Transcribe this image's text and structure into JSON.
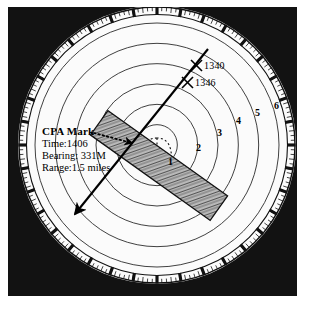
{
  "figure": {
    "name": "radar-plotting-scope"
  },
  "scope": {
    "background_color": "#121212",
    "face_color": "#ffffff",
    "line_color": "#1a1a1a",
    "center": {
      "x": 157,
      "y": 145
    },
    "compass_rose_radius": 138,
    "range_ring_count": 6
  },
  "cpa": {
    "title": "CPA Mark",
    "time_label": "Time:1406",
    "bearing_label": "Bearing: 331M",
    "range_label": "Range:1.5 miles"
  },
  "targets": [
    {
      "mark": "X",
      "label": "1340",
      "text": "X 1340"
    },
    {
      "mark": "X",
      "label": "1346",
      "text": "X 1346"
    }
  ],
  "range_rings": {
    "labels": [
      "1",
      "2",
      "3",
      "4",
      "5",
      "6"
    ],
    "unit": "miles"
  },
  "chart_data": {
    "type": "scatter",
    "categories": [
      "1",
      "2",
      "3",
      "4",
      "5",
      "6"
    ],
    "values": [
      1,
      2,
      3,
      4,
      5,
      6
    ],
    "xlabel": "",
    "ylabel": "",
    "annotations": [
      "CPA Mark",
      "Time:1406",
      "Bearing: 331M",
      "Range:1.5 miles",
      "X 1340",
      "X 1346"
    ]
  }
}
